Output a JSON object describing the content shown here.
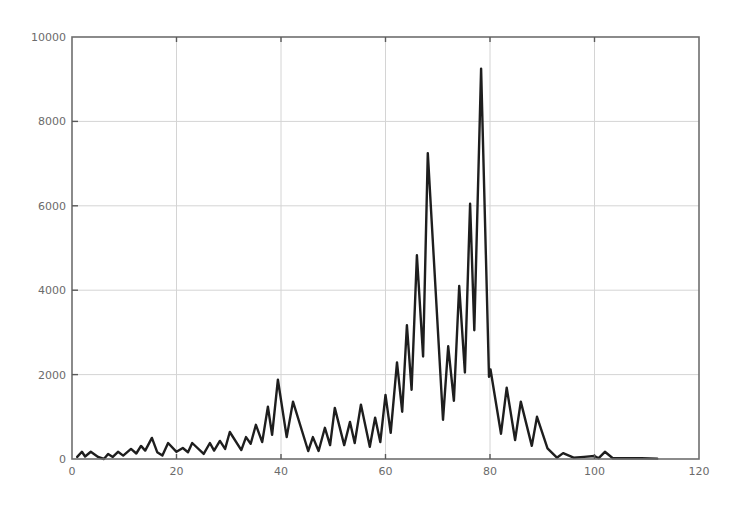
{
  "chart_data": {
    "type": "line",
    "title": "",
    "xlabel": "",
    "ylabel": "",
    "xlim": [
      0,
      120
    ],
    "ylim": [
      0,
      10000
    ],
    "xticks": [
      0,
      20,
      40,
      60,
      80,
      100,
      120
    ],
    "yticks": [
      0,
      2000,
      4000,
      6000,
      8000,
      10000
    ],
    "xtick_labels": [
      "0",
      "20",
      "40",
      "60",
      "80",
      "100",
      "120"
    ],
    "ytick_labels": [
      "0",
      "2000",
      "4000",
      "6000",
      "8000",
      "10000"
    ],
    "grid": true,
    "legend": null,
    "colors": {
      "line": "#1e1e1e",
      "grid": "#d4d4d4",
      "axis": "#6e6e6e",
      "text": "#6b6b6b"
    },
    "series": [
      {
        "name": "series-1",
        "x": [
          1.0,
          1.9,
          2.5,
          3.6,
          5.0,
          6.1,
          6.9,
          7.8,
          8.8,
          9.8,
          11.3,
          12.3,
          13.2,
          14.0,
          15.3,
          16.3,
          17.3,
          18.4,
          20.0,
          21.2,
          22.2,
          23.0,
          25.2,
          26.4,
          27.2,
          28.3,
          29.3,
          30.2,
          32.4,
          33.3,
          34.2,
          35.2,
          36.4,
          37.5,
          38.3,
          39.4,
          41.1,
          42.3,
          45.2,
          46.1,
          47.2,
          48.4,
          49.4,
          50.3,
          52.1,
          53.2,
          54.1,
          55.3,
          57.0,
          58.0,
          59.0,
          60.0,
          61.0,
          62.2,
          63.2,
          64.1,
          65.0,
          66.0,
          67.2,
          68.1,
          71.0,
          72.0,
          73.1,
          74.1,
          75.2,
          76.2,
          77.0,
          78.3,
          79.8,
          80.1,
          82.1,
          83.2,
          84.8,
          85.9,
          88.0,
          89.0,
          91.0,
          92.8,
          94.0,
          96.0,
          98.0,
          100.0,
          100.8,
          102.0,
          103.5,
          106.0,
          109.0,
          112.0
        ],
        "y": [
          50,
          170,
          60,
          170,
          50,
          0,
          120,
          50,
          170,
          80,
          240,
          130,
          310,
          200,
          500,
          160,
          80,
          380,
          170,
          260,
          160,
          380,
          120,
          380,
          200,
          430,
          240,
          640,
          210,
          520,
          360,
          810,
          400,
          1240,
          570,
          1880,
          520,
          1360,
          190,
          520,
          190,
          740,
          330,
          1210,
          330,
          880,
          380,
          1290,
          290,
          980,
          400,
          1520,
          620,
          2290,
          1120,
          3170,
          1640,
          4830,
          2430,
          7250,
          930,
          2670,
          1380,
          4100,
          2050,
          6050,
          3050,
          9250,
          1950,
          2120,
          600,
          1690,
          450,
          1360,
          310,
          1000,
          250,
          30,
          140,
          30,
          50,
          70,
          20,
          170,
          20,
          20,
          20,
          10
        ]
      }
    ]
  }
}
